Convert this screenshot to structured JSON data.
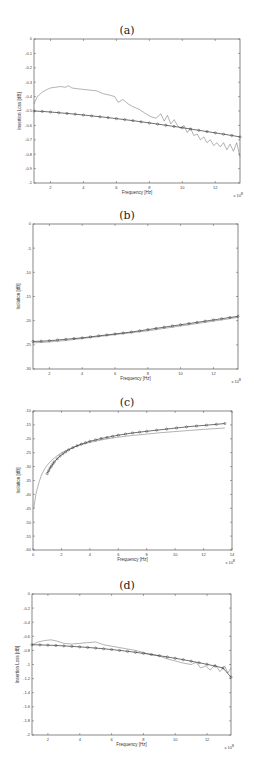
{
  "chart_data": [
    {
      "id": "a",
      "type": "line",
      "title": "(a)",
      "xlabel": "Frequency [Hz]",
      "ylabel": "Insertion Loss [dB]",
      "x_multiplier": "x 10^8",
      "xlim": [
        1,
        13.5
      ],
      "ylim": [
        -1,
        0
      ],
      "xticks": [
        2,
        4,
        6,
        8,
        10,
        12
      ],
      "yticks": [
        0,
        -0.1,
        -0.2,
        -0.3,
        -0.4,
        -0.5,
        -0.6,
        -0.7,
        -0.8,
        -0.9,
        -1
      ],
      "ytick_labels": [
        "0",
        "-0.1",
        "-0.2",
        "-0.3",
        "-0.4",
        "-0.5",
        "-0.6",
        "-0.7",
        "-0.8",
        "-0.9",
        "-1"
      ],
      "grid": false,
      "legend": null,
      "box": {
        "left": 34,
        "top": 39,
        "right": 240,
        "bottom": 183
      },
      "series": [
        {
          "name": "measured",
          "style": "thin-noisy-line",
          "x": [
            1.0,
            1.2,
            1.5,
            1.8,
            2.0,
            2.3,
            2.6,
            2.9,
            3.1,
            3.3,
            3.6,
            4.0,
            4.4,
            4.8,
            5.2,
            5.6,
            5.9,
            6.1,
            6.4,
            6.7,
            7.0,
            7.4,
            7.8,
            8.1,
            8.4,
            8.7,
            8.9,
            9.1,
            9.3,
            9.5,
            9.7,
            9.9,
            10.1,
            10.3,
            10.5,
            10.7,
            10.9,
            11.1,
            11.3,
            11.5,
            11.7,
            11.9,
            12.1,
            12.3,
            12.5,
            12.7,
            12.9,
            13.1,
            13.3,
            13.5
          ],
          "y": [
            -0.45,
            -0.4,
            -0.37,
            -0.35,
            -0.34,
            -0.335,
            -0.33,
            -0.335,
            -0.325,
            -0.34,
            -0.345,
            -0.35,
            -0.355,
            -0.36,
            -0.38,
            -0.39,
            -0.4,
            -0.44,
            -0.42,
            -0.45,
            -0.47,
            -0.49,
            -0.52,
            -0.54,
            -0.55,
            -0.52,
            -0.57,
            -0.53,
            -0.59,
            -0.56,
            -0.6,
            -0.62,
            -0.6,
            -0.65,
            -0.62,
            -0.67,
            -0.66,
            -0.7,
            -0.68,
            -0.72,
            -0.7,
            -0.74,
            -0.72,
            -0.75,
            -0.72,
            -0.77,
            -0.73,
            -0.78,
            -0.72,
            -0.82
          ]
        },
        {
          "name": "simulated",
          "style": "line-with-circle-markers",
          "x": [
            1.0,
            1.5,
            2.0,
            2.5,
            3.0,
            3.5,
            4.0,
            4.5,
            5.0,
            5.5,
            6.0,
            6.5,
            7.0,
            7.5,
            8.0,
            8.5,
            9.0,
            9.5,
            10.0,
            10.5,
            11.0,
            11.5,
            12.0,
            12.5,
            13.0,
            13.5
          ],
          "y": [
            -0.5,
            -0.503,
            -0.507,
            -0.512,
            -0.517,
            -0.522,
            -0.528,
            -0.534,
            -0.54,
            -0.546,
            -0.553,
            -0.56,
            -0.567,
            -0.575,
            -0.583,
            -0.591,
            -0.599,
            -0.607,
            -0.616,
            -0.625,
            -0.634,
            -0.643,
            -0.652,
            -0.661,
            -0.67,
            -0.68
          ]
        }
      ]
    },
    {
      "id": "b",
      "type": "line",
      "title": "(b)",
      "xlabel": "Frequency [Hz]",
      "ylabel": "Isolation [dB]",
      "x_multiplier": "x 10^8",
      "xlim": [
        1,
        13.5
      ],
      "ylim": [
        -30,
        0
      ],
      "xticks": [
        2,
        4,
        6,
        8,
        10,
        12
      ],
      "yticks": [
        0,
        -5,
        -10,
        -15,
        -20,
        -25,
        -30
      ],
      "ytick_labels": [
        "0",
        "-5",
        "-10",
        "-15",
        "-20",
        "-25",
        "-30"
      ],
      "grid": false,
      "legend": null,
      "box": {
        "left": 33,
        "top": 224,
        "right": 238,
        "bottom": 369
      },
      "series": [
        {
          "name": "measured",
          "style": "thin-line",
          "x": [
            1.0,
            2.0,
            3.0,
            4.0,
            5.0,
            6.0,
            7.0,
            8.0,
            9.0,
            10.0,
            11.0,
            12.0,
            13.0,
            13.5
          ],
          "y": [
            -24.6,
            -24.4,
            -24.1,
            -23.7,
            -23.3,
            -22.9,
            -22.5,
            -22.1,
            -21.6,
            -21.1,
            -20.6,
            -20.1,
            -19.6,
            -19.3
          ]
        },
        {
          "name": "simulated",
          "style": "line-with-circle-markers",
          "x": [
            1.0,
            1.5,
            2.0,
            2.5,
            3.0,
            3.5,
            4.0,
            4.5,
            5.0,
            5.5,
            6.0,
            6.5,
            7.0,
            7.5,
            8.0,
            8.5,
            9.0,
            9.5,
            10.0,
            10.5,
            11.0,
            11.5,
            12.0,
            12.5,
            13.0,
            13.5
          ],
          "y": [
            -24.3,
            -24.25,
            -24.15,
            -24.0,
            -23.85,
            -23.7,
            -23.55,
            -23.35,
            -23.15,
            -22.95,
            -22.75,
            -22.55,
            -22.35,
            -22.1,
            -21.85,
            -21.6,
            -21.35,
            -21.1,
            -20.85,
            -20.6,
            -20.35,
            -20.1,
            -19.85,
            -19.6,
            -19.35,
            -19.1
          ]
        }
      ]
    },
    {
      "id": "c",
      "type": "line",
      "title": "(c)",
      "xlabel": "Frequency [Hz]",
      "ylabel": "Isolation [dB]",
      "x_multiplier": "x 10^8",
      "xlim": [
        0,
        14
      ],
      "ylim": [
        -60,
        -10
      ],
      "xticks": [
        0,
        2,
        4,
        6,
        8,
        10,
        12,
        14
      ],
      "yticks": [
        -10,
        -15,
        -20,
        -25,
        -30,
        -35,
        -40,
        -45,
        -50,
        -55,
        -60
      ],
      "ytick_labels": [
        "-10",
        "-15",
        "-20",
        "-25",
        "-30",
        "-35",
        "-40",
        "-45",
        "-50",
        "-55",
        "-60"
      ],
      "grid": false,
      "legend": null,
      "box": {
        "left": 33,
        "top": 411,
        "right": 232,
        "bottom": 550
      },
      "series": [
        {
          "name": "measured",
          "style": "thin-line",
          "x": [
            0.05,
            0.2,
            0.4,
            0.6,
            0.8,
            1.0,
            1.3,
            1.6,
            2.0,
            2.5,
            3.0,
            3.5,
            4.0,
            5.0,
            6.0,
            7.0,
            8.0,
            9.0,
            10.0,
            11.0,
            12.0,
            13.0,
            13.5
          ],
          "y": [
            -45,
            -40,
            -36,
            -33,
            -31,
            -29.5,
            -27.8,
            -26.5,
            -25,
            -23.8,
            -22.8,
            -22.0,
            -21.3,
            -20.2,
            -19.4,
            -18.8,
            -18.3,
            -17.8,
            -17.4,
            -17.0,
            -16.6,
            -16.3,
            -16.1
          ]
        },
        {
          "name": "simulated",
          "style": "line-with-circle-markers",
          "x": [
            1.0,
            1.1,
            1.2,
            1.3,
            1.4,
            1.5,
            1.7,
            1.9,
            2.1,
            2.3,
            2.5,
            2.8,
            3.1,
            3.4,
            3.7,
            4.0,
            4.4,
            4.8,
            5.2,
            5.6,
            6.0,
            6.5,
            7.0,
            7.5,
            8.0,
            8.7,
            9.4,
            10.1,
            10.8,
            11.5,
            12.2,
            12.9,
            13.5
          ],
          "y": [
            -32.5,
            -31.5,
            -30.5,
            -29.8,
            -29.0,
            -28.3,
            -27.2,
            -26.2,
            -25.4,
            -24.7,
            -24.0,
            -23.2,
            -22.5,
            -21.9,
            -21.4,
            -20.9,
            -20.4,
            -19.9,
            -19.5,
            -19.1,
            -18.7,
            -18.3,
            -17.9,
            -17.6,
            -17.3,
            -16.9,
            -16.5,
            -16.1,
            -15.7,
            -15.4,
            -15.1,
            -14.8,
            -14.5
          ]
        }
      ]
    },
    {
      "id": "d",
      "type": "line",
      "title": "(d)",
      "xlabel": "Frequency [Hz]",
      "ylabel": "Insertion Loss [dB]",
      "x_multiplier": "x 10^8",
      "xlim": [
        1,
        13.5
      ],
      "ylim": [
        -2,
        0
      ],
      "xticks": [
        2,
        4,
        6,
        8,
        10,
        12
      ],
      "yticks": [
        0,
        -0.2,
        -0.4,
        -0.6,
        -0.8,
        -1,
        -1.2,
        -1.4,
        -1.6,
        -1.8,
        -2
      ],
      "ytick_labels": [
        "0",
        "-0.2",
        "-0.4",
        "-0.6",
        "-0.8",
        "-1",
        "-1.2",
        "-1.4",
        "-1.6",
        "-1.8",
        "-2"
      ],
      "grid": false,
      "legend": null,
      "box": {
        "left": 32,
        "top": 594,
        "right": 231,
        "bottom": 735
      },
      "series": [
        {
          "name": "measured",
          "style": "thin-noisy-line",
          "x": [
            1.0,
            1.4,
            1.8,
            2.2,
            2.6,
            3.0,
            3.5,
            4.0,
            4.5,
            5.0,
            5.5,
            6.0,
            6.5,
            7.0,
            7.5,
            8.0,
            8.5,
            9.0,
            9.5,
            10.0,
            10.5,
            11.0,
            11.3,
            11.6,
            11.9,
            12.2,
            12.5,
            12.8,
            13.1,
            13.3,
            13.5
          ],
          "y": [
            -0.72,
            -0.68,
            -0.66,
            -0.65,
            -0.67,
            -0.7,
            -0.71,
            -0.7,
            -0.69,
            -0.68,
            -0.72,
            -0.74,
            -0.76,
            -0.78,
            -0.8,
            -0.83,
            -0.86,
            -0.88,
            -0.92,
            -0.95,
            -0.98,
            -1.0,
            -0.97,
            -1.05,
            -1.02,
            -1.08,
            -1.0,
            -1.1,
            -1.02,
            -1.12,
            -1.05
          ]
        },
        {
          "name": "simulated",
          "style": "line-with-circle-markers",
          "x": [
            1.0,
            1.5,
            2.0,
            2.5,
            3.0,
            3.5,
            4.0,
            4.5,
            5.0,
            5.5,
            6.0,
            6.5,
            7.0,
            7.5,
            8.0,
            8.5,
            9.0,
            9.5,
            10.0,
            10.5,
            11.0,
            11.5,
            12.0,
            12.5,
            13.0,
            13.5
          ],
          "y": [
            -0.72,
            -0.722,
            -0.726,
            -0.73,
            -0.736,
            -0.743,
            -0.75,
            -0.758,
            -0.767,
            -0.777,
            -0.788,
            -0.8,
            -0.813,
            -0.827,
            -0.842,
            -0.858,
            -0.875,
            -0.893,
            -0.912,
            -0.932,
            -0.953,
            -0.975,
            -0.998,
            -1.022,
            -1.05,
            -1.18
          ]
        }
      ]
    }
  ]
}
